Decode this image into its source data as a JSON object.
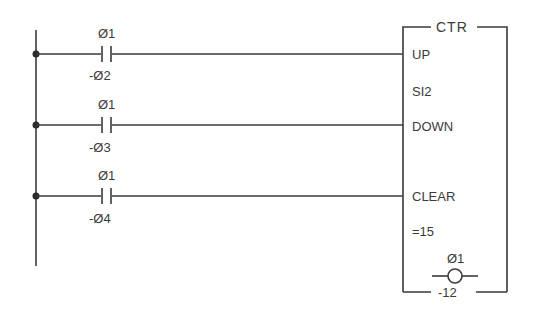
{
  "diagram": {
    "type": "ladder-logic",
    "colors": {
      "line": "#3a3a3a",
      "background": "#ffffff"
    },
    "rungs": [
      {
        "contact": {
          "type": "normally-open",
          "label_top": "Ø1",
          "label_bottom": "-Ø2"
        },
        "input": "UP"
      },
      {
        "contact": {
          "type": "normally-open",
          "label_top": "Ø1",
          "label_bottom": "-Ø3"
        },
        "input": "DOWN"
      },
      {
        "contact": {
          "type": "normally-open",
          "label_top": "Ø1",
          "label_bottom": "-Ø4"
        },
        "input": "CLEAR"
      }
    ],
    "function_block": {
      "title": "CTR",
      "inputs": [
        "UP",
        "DOWN",
        "CLEAR"
      ],
      "address": "SI2",
      "preset": "=15",
      "output_coil": {
        "label_top": "Ø1",
        "label_bottom": "-12"
      }
    }
  }
}
